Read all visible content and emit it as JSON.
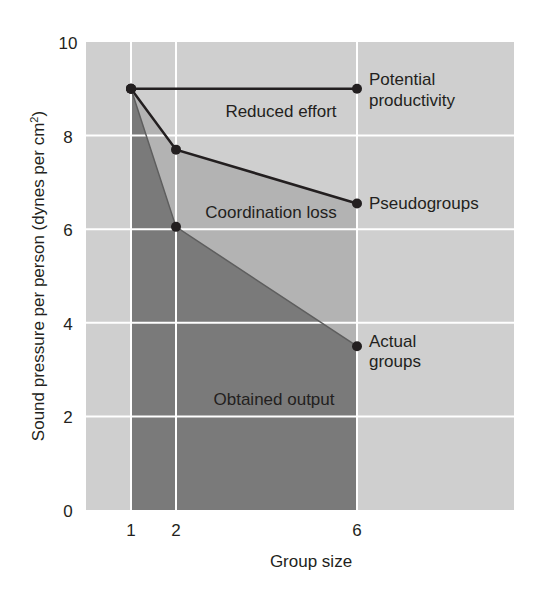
{
  "chart_data": {
    "type": "line",
    "title": "",
    "xlabel": "Group size",
    "ylabel": "Sound pressure per person (dynes per cm²)",
    "ylabel_parts": {
      "main": "Sound pressure per person (dynes per cm",
      "sup": "2",
      "end": ")"
    },
    "xlim": [
      0,
      9.5
    ],
    "ylim": [
      0,
      10
    ],
    "x_ticks": [
      1,
      2,
      6
    ],
    "y_ticks": [
      0,
      2,
      4,
      6,
      8,
      10
    ],
    "grid": true,
    "legend": "none (inline labels)",
    "series": [
      {
        "name": "Potential productivity",
        "label_lines": [
          "Potential",
          "productivity"
        ],
        "x": [
          1,
          6
        ],
        "values": [
          9.0,
          9.0
        ]
      },
      {
        "name": "Pseudogroups",
        "label_lines": [
          "Pseudogroups"
        ],
        "x": [
          1,
          2,
          6
        ],
        "values": [
          9.0,
          7.7,
          6.55
        ]
      },
      {
        "name": "Actual groups",
        "label_lines": [
          "Actual",
          "groups"
        ],
        "x": [
          1,
          2,
          6
        ],
        "values": [
          9.0,
          6.05,
          3.5
        ]
      }
    ],
    "regions": [
      {
        "name": "Reduced effort",
        "between": [
          "Potential productivity",
          "Pseudogroups"
        ]
      },
      {
        "name": "Coordination loss",
        "between": [
          "Pseudogroups",
          "Actual groups"
        ]
      },
      {
        "name": "Obtained output",
        "between": [
          "Actual groups",
          "x-axis"
        ]
      }
    ],
    "annotations": [
      "Reduced effort",
      "Coordination loss",
      "Obtained output",
      "Potential productivity",
      "Pseudogroups",
      "Actual groups"
    ]
  },
  "colors": {
    "background_light": "#cfcfcf",
    "region_mid": "#b3b3b3",
    "region_dark": "#7a7a7a",
    "grid": "#ffffff",
    "line": "#231f20",
    "text": "#231f20"
  }
}
